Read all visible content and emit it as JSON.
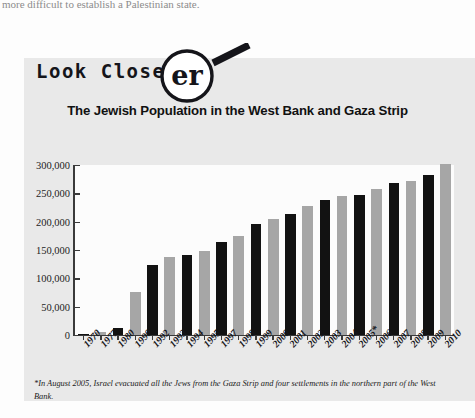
{
  "page": {
    "cut_off_line": "more difficult to establish a Palestinian state."
  },
  "badge": {
    "label": "Look Closer",
    "magnifier_icon": "magnifying-glass-icon",
    "magnified_letters": "er"
  },
  "footnote": "*In August 2005, Israel evacuated all the Jews from the Gaza Strip and four settlements in the northern part of the West Bank.",
  "colors": {
    "panel_background": "#e9e9e9",
    "plot_background": "#fcfcfc",
    "bar_dark": "#121212",
    "bar_light": "#a6a6a6",
    "axis": "#3a3a3a",
    "text": "#15151a"
  },
  "chart_data": {
    "type": "bar",
    "title": "The Jewish Population in the West Bank and Gaza Strip",
    "xlabel": "",
    "ylabel": "",
    "ylim": [
      0,
      300000
    ],
    "ytick_values": [
      0,
      50000,
      100000,
      150000,
      200000,
      250000,
      300000
    ],
    "ytick_labels": [
      "0",
      "50,000",
      "100,000",
      "150,000",
      "200,000",
      "250,000",
      "300,000"
    ],
    "grid": false,
    "legend": "none",
    "bar_color_cycle": [
      "dark",
      "light"
    ],
    "categories": [
      "1970",
      "1977",
      "1980",
      "1990",
      "1992",
      "1993",
      "1994",
      "1995",
      "1997",
      "1998",
      "1999",
      "2000",
      "2001",
      "2002",
      "2003",
      "2004",
      "2005*",
      "2006",
      "2007",
      "2008",
      "2009",
      "2010"
    ],
    "values": [
      1000,
      5000,
      12000,
      76000,
      123000,
      137000,
      142000,
      148000,
      164000,
      175000,
      196000,
      204000,
      213000,
      227000,
      238000,
      246000,
      247000,
      257000,
      269000,
      272000,
      282000,
      302000
    ],
    "series": [
      {
        "name": "Jewish population in the West Bank and Gaza Strip",
        "values": [
          1000,
          5000,
          12000,
          76000,
          123000,
          137000,
          142000,
          148000,
          164000,
          175000,
          196000,
          204000,
          213000,
          227000,
          238000,
          246000,
          247000,
          257000,
          269000,
          272000,
          282000,
          302000
        ]
      }
    ]
  }
}
